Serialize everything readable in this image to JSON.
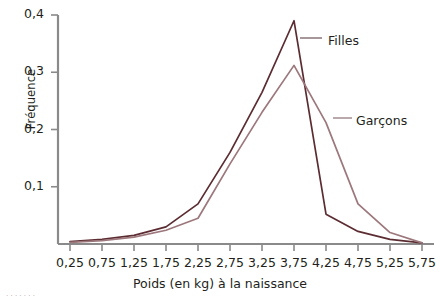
{
  "chart_data": {
    "type": "line",
    "title": "",
    "xlabel": "Poids (en kg) à la naissance",
    "ylabel": "Fréquence",
    "x": [
      0.25,
      0.75,
      1.25,
      1.75,
      2.25,
      2.75,
      3.25,
      3.75,
      4.25,
      4.75,
      5.25,
      5.75
    ],
    "xtick_labels": [
      "0,25",
      "0,75",
      "1,25",
      "1,75",
      "2,25",
      "2,75",
      "3,25",
      "3,75",
      "4,25",
      "4,75",
      "5,25",
      "5,75"
    ],
    "ytick_labels": [
      "0,1",
      "0,2",
      "0,3",
      "0,4"
    ],
    "yticks": [
      0.1,
      0.2,
      0.3,
      0.4
    ],
    "xlim": [
      0.25,
      5.75
    ],
    "ylim": [
      0,
      0.4
    ],
    "grid": false,
    "legend_position": "inline-annotations",
    "series": [
      {
        "name": "Filles",
        "color": "#5b2c31",
        "values": [
          0.004,
          0.008,
          0.015,
          0.03,
          0.07,
          0.16,
          0.265,
          0.39,
          0.052,
          0.022,
          0.008,
          0.002
        ]
      },
      {
        "name": "Garçons",
        "color": "#9c777c",
        "values": [
          0.003,
          0.006,
          0.012,
          0.024,
          0.045,
          0.14,
          0.23,
          0.312,
          0.212,
          0.07,
          0.02,
          0.002
        ]
      }
    ],
    "annotations": [
      {
        "text": "Filles",
        "x_px": 328,
        "y_px": 33
      },
      {
        "text": "Garçons",
        "x_px": 356,
        "y_px": 113
      }
    ]
  },
  "axes": {
    "axis_color": "#8a8a8a",
    "text_color": "#231f20"
  },
  "footnote": {
    "text": "· · · · · · ·"
  }
}
